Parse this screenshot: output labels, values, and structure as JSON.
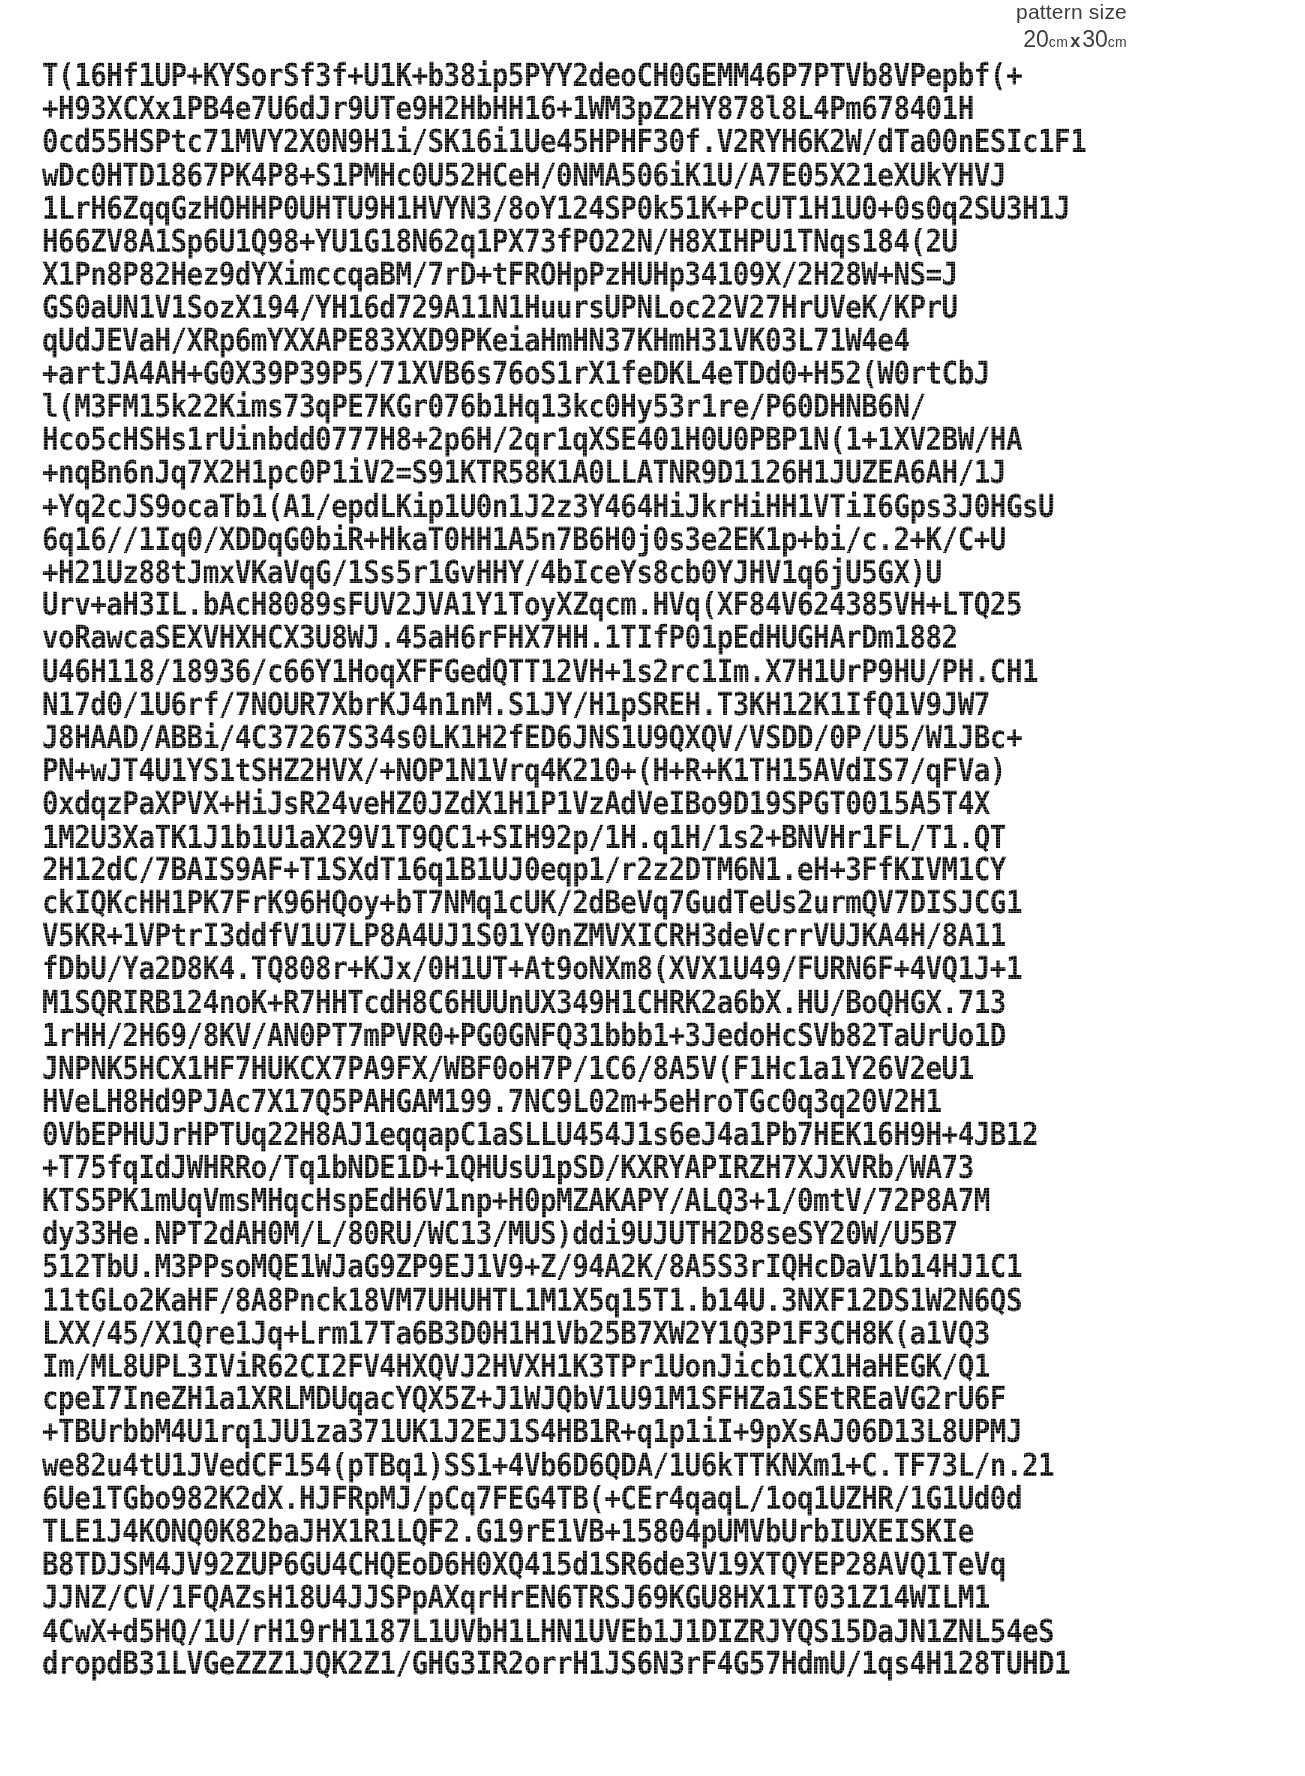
{
  "page": {
    "background_color": "#ffffff",
    "text_color": "#000000",
    "header_text_color": "#3d3d3d"
  },
  "header": {
    "title": "pattern size",
    "width_value": "20",
    "width_unit": "cm",
    "separator": "x",
    "height_value": "30",
    "height_unit": "cm",
    "full_dimensions": "20 cm x 30 cm"
  },
  "pattern_data": {
    "label": "pattern data block",
    "line_count": 52,
    "chars_per_line": 66,
    "lines": [
      "T(16Hf1UP+KYSorSf3f+U1K+b38ip5PYY2deoCH0GEMM46P7PTVb8VPepbf(+",
      "+H93XCXx1PB4e7U6dJr9UTe9H2HbHH16+1WM3pZ2HY878l8L4Pm678401H",
      "0cd55HSPtc71MVY2X0N9H1i/SK16i1Ue45HPHF30f.V2RYH6K2W/dTa00nESIc1F1",
      "wDc0HTD1867PK4P8+S1PMHc0U52HCeH/0NMA506iK1U/A7E05X21eXUkYHVJ",
      "1LrH6ZqqGzHOHHP0UHTU9H1HVYN3/8oY124SP0k51K+PcUT1H1U0+0s0q2SU3H1J",
      "H66ZV8A1Sp6U1Q98+YU1G18N62q1PX73fPO22N/H8XIHPU1TNqs184(2U",
      "X1Pn8P82Hez9dYXimccqaBM/7rD+tFROHpPzHUHp34109X/2H28W+NS=J",
      "GS0aUN1V1SozX194/YH16d729A11N1HuursUPNLoc22V27HrUVeK/KPrU",
      "qUdJEVaH/XRp6mYXXAPE83XXD9PKeiaHmHN37KHmH31VK03L71W4e4",
      "+artJA4AH+G0X39P39P5/71XVB6s76oS1rX1feDKL4eTDd0+H52(W0rtCbJ",
      "l(M3FM15k22Kims73qPE7KGr076b1Hq13kc0Hy53r1re/P60DHNB6N/",
      "Hco5cHSHs1rUinbdd0777H8+2p6H/2qr1qXSE401H0U0PBP1N(1+1XV2BW/HA",
      "+nqBn6nJq7X2H1pc0P1iV2=S91KTR58K1A0LLATNR9D1126H1JUZEA6AH/1J",
      "+Yq2cJS9ocaTb1(A1/epdLKip1U0n1J2z3Y464HiJkrHiHH1VTiI6Gps3J0HGsU",
      "6q16//1Iq0/XDDqG0biR+HkaT0HH1A5n7B6H0j0s3e2EK1p+bi/c.2+K/C+U",
      "+H21Uz88tJmxVKaVqG/1Ss5r1GvHHY/4bIceYs8cb0YJHV1q6jU5GX)U",
      "Urv+aH3IL.bAcH8089sFUV2JVA1Y1ToyXZqcm.HVq(XF84V624385VH+LTQ25",
      "voRawcaSEXVHXHCX3U8WJ.45aH6rFHX7HH.1TIfP01pEdHUGHArDm1882",
      "U46H118/18936/c66Y1HoqXFFGedQTT12VH+1s2rc1Im.X7H1UrP9HU/PH.CH1",
      "N17d0/1U6rf/7NOUR7XbrKJ4n1nM.S1JY/H1pSREH.T3KH12K1IfQ1V9JW7",
      "J8HAAD/ABBi/4C37267S34s0LK1H2fED6JNS1U9QXQV/VSDD/0P/U5/W1JBc+",
      "PN+wJT4U1YS1tSHZ2HVX/+NOP1N1Vrq4K210+(H+R+K1TH15AVdIS7/qFVa)",
      "0xdqzPaXPVX+HiJsR24veHZ0JZdX1H1P1VzAdVeIBo9D19SPGT0015A5T4X",
      "1M2U3XaTK1J1b1U1aX29V1T9QC1+SIH92p/1H.q1H/1s2+BNVHr1FL/T1.QT",
      "2H12dC/7BAIS9AF+T1SXdT16q1B1UJ0eqp1/r2z2DTM6N1.eH+3FfKIVM1CY",
      "ckIQKcHH1PK7FrK96HQoy+bT7NMq1cUK/2dBeVq7GudTeUs2urmQV7DISJCG1",
      "V5KR+1VPtrI3ddfV1U7LP8A4UJ1S01Y0nZMVXICRH3deVcrrVUJKA4H/8A11",
      "fDbU/Ya2D8K4.TQ808r+KJx/0H1UT+At9oNXm8(XVX1U49/FURN6F+4VQ1J+1",
      "M1SQRIRB124noK+R7HHTcdH8C6HUUnUX349H1CHRK2a6bX.HU/BoQHGX.713",
      "1rHH/2H69/8KV/AN0PT7mPVR0+PG0GNFQ31bbb1+3JedoHcSVb82TaUrUo1D",
      "JNPNK5HCX1HF7HUKCX7PA9FX/WBF0oH7P/1C6/8A5V(F1Hc1a1Y26V2eU1",
      "HVeLH8Hd9PJAc7X17Q5PAHGAM199.7NC9L02m+5eHroTGc0q3q20V2H1",
      "0VbEPHUJrHPTUq22H8AJ1eqqapC1aSLLU454J1s6eJ4a1Pb7HEK16H9H+4JB12",
      "+T75fqIdJWHRRo/Tq1bNDE1D+1QHUsU1pSD/KXRYAPIRZH7XJXVRb/WA73",
      "KTS5PK1mUqVmsMHqcHspEdH6V1np+H0pMZAKAPY/ALQ3+1/0mtV/72P8A7M",
      "dy33He.NPT2dAH0M/L/80RU/WC13/MUS)ddi9UJUTH2D8seSY20W/U5B7",
      "512TbU.M3PPsoMQE1WJaG9ZP9EJ1V9+Z/94A2K/8A5S3rIQHcDaV1b14HJ1C1",
      "11tGLo2KaHF/8A8Pnck18VM7UHUHTL1M1X5q15T1.b14U.3NXF12DS1W2N6QS",
      "LXX/45/X1Qre1Jq+Lrm17Ta6B3D0H1H1Vb25B7XW2Y1Q3P1F3CH8K(a1VQ3",
      "Im/ML8UPL3IViR62CI2FV4HXQVJ2HVXH1K3TPr1UonJicb1CX1HaHEGK/Q1",
      "cpeI7IneZH1a1XRLMDUqacYQX5Z+J1WJQbV1U91M1SFHZa1SEtREaVG2rU6F",
      "+TBUrbbM4U1rq1JU1za371UK1J2EJ1S4HB1R+q1p1iI+9pXsAJ06D13L8UPMJ",
      "we82u4tU1JVedCF154(pTBq1)SS1+4Vb6D6QDA/1U6kTTKNXm1+C.TF73L/n.21",
      "6Ue1TGbo982K2dX.HJFRpMJ/pCq7FEG4TB(+CEr4qaqL/1oq1UZHR/1G1Ud0d",
      "TLE1J4KONQ0K82baJHX1R1LQF2.G19rE1VB+15804pUMVbUrbIUXEISKIe",
      "B8TDJSM4JV92ZUP6GU4CHQEoD6H0XQ415d1SR6de3V19XTQYEP28AVQ1TeVq",
      "JJNZ/CV/1FQAZsH18U4JJSPpAXqrHrEN6TRSJ69KGU8HX1IT031Z14WILM1",
      "4CwX+d5HQ/1U/rH19rH1187L1UVbH1LHN1UVEb1J1DIZRJYQS15DaJN1ZNL54eS",
      "dropdB31LVGeZZZ1JQK2Z1/GHG3IR2orrH1JS6N3rF4G57HdmU/1qs4H128TUHD1",
      "qGdoeSSJUmUTb1rMJXnqPISEW/9KLS3VQ1W1L1ULa1UGX.1D6M15DqFJUJ1",
      "1cB5rIM28W2HK1J61V12U1K+3KVJ1qq34V/TN14Vm281Y7P7.MLTR1ZG1",
      "1V1iBuJ1eVUc1L+HIcmd1cvHLZd1ss6aRDdcrmDdaSUb2W7TFB0H4rPb",
      "(MPF19d22K/Y03a4+TISHHU8N1JTrut1H1.p1JJc4597K1XpedeS1SFQ1TbqKNNJ2",
      "vec1SKpHV6rd6H1LbU1Is1QTS)0md8ccq91LMc1adTDb70HdHmMK271ac",
      "BY12HV1md9DIdDKQ24U4CKQV24VqmHAXHG4+4HX7X1Q4S11DLMQkKa1GX1",
      "JT3GLS4HH31121HJPSUJ21GH+NT2/1112S12/141ST.1+VPFV1I6Q21QC651H12H"
    ]
  }
}
